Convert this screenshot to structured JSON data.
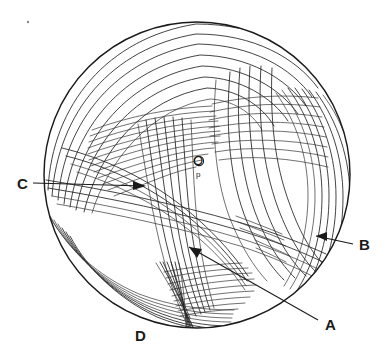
{
  "figure": {
    "type": "line-drawing",
    "background_color": "#ffffff",
    "ink_color": "#1a1a1a",
    "circle": {
      "center_x": 197,
      "center_y": 175,
      "radius": 155,
      "stroke_width": 1.45
    }
  },
  "labels": {
    "a": "A",
    "b": "B",
    "c": "C",
    "d": "D",
    "origin": "O",
    "origin_marker": "p"
  },
  "callouts": [
    {
      "id": "callout-a",
      "label": "A",
      "label_x": 325,
      "label_y": 327,
      "leader_from_x": 318,
      "leader_from_y": 320,
      "leader_to_x": 189,
      "leader_to_y": 247,
      "arrow": true,
      "arrow_direction": "up-left"
    },
    {
      "id": "callout-b",
      "label": "B",
      "label_x": 361,
      "label_y": 250,
      "leader_from_x": 355,
      "leader_from_y": 245,
      "leader_to_x": 316,
      "leader_to_y": 236,
      "arrow": true,
      "arrow_direction": "left"
    },
    {
      "id": "callout-c",
      "label": "C",
      "label_x": 22,
      "label_y": 188,
      "leader_from_x": 33,
      "leader_from_y": 183,
      "leader_to_x": 144,
      "leader_to_y": 186,
      "arrow": true,
      "arrow_direction": "right"
    },
    {
      "id": "callout-d",
      "label": "D",
      "label_x": 140,
      "label_y": 338,
      "leader": false,
      "arrow": false
    }
  ],
  "origin_point": {
    "label": "O",
    "label_x": 195,
    "label_y": 165,
    "marker_x": 199,
    "marker_y": 166,
    "marker_radius": 4.4,
    "sub_label": "p",
    "sub_label_x": 196,
    "sub_label_y": 180
  },
  "bundles": [
    {
      "name": "upper-left-outer-arcs",
      "count": 7,
      "description": "Nested arcs sweeping from left edge over the top-left quadrant"
    },
    {
      "name": "upper-left-inner-fan",
      "count": 12,
      "description": "Dense flat fan of near-horizontal lines in upper-left interior"
    },
    {
      "name": "upper-right-vertical-curves",
      "count": 6,
      "description": "Long vertical curves descending from top-center to lower-right"
    },
    {
      "name": "upper-right-horizontal-fan",
      "count": 8,
      "description": "Near-horizontal fan crossing the right-of-centre region"
    },
    {
      "name": "right-edge-bundle",
      "count": 9,
      "description": "Tight bundle of long curves hugging the right rim, target of callout B"
    },
    {
      "name": "centre-crossing-bundle",
      "count": 8,
      "description": "Curves sweeping from upper-left through centre down to point D"
    },
    {
      "name": "lower-left-arcs",
      "count": 7,
      "description": "Nested arcs in the lower-left quadrant running toward D"
    },
    {
      "name": "lower-centre-fan",
      "count": 9,
      "description": "Fan of lines radiating right from the convergence node D"
    },
    {
      "name": "d-convergence-sheaf",
      "count": 7,
      "description": "Sheaf of steep curves converging and crossing at node D"
    }
  ],
  "speck": {
    "x": 28,
    "y": 22,
    "radius": 1.2
  }
}
